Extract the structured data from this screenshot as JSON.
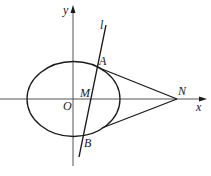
{
  "diagram": {
    "type": "geometry",
    "colors": {
      "stroke": "#1a1a1a",
      "axis": "#555555",
      "background": "#ffffff"
    },
    "axes": {
      "x_label": "x",
      "y_label": "y",
      "origin_label": "O"
    },
    "line": {
      "label": "l"
    },
    "points": {
      "A": "A",
      "B": "B",
      "M": "M",
      "N": "N"
    }
  }
}
